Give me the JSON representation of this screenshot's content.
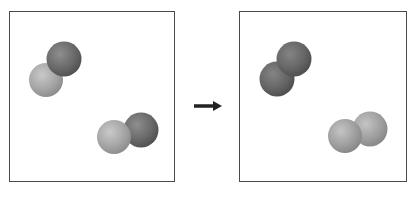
{
  "diagram": {
    "colors": {
      "dark_atom": "#6e6e6e",
      "light_atom": "#a8a8a8",
      "border": "#4a4a4a",
      "arrow": "#222222"
    },
    "panels": [
      {
        "label": "reactants",
        "molecules": [
          {
            "atoms": [
              "light",
              "dark"
            ]
          },
          {
            "atoms": [
              "light",
              "dark"
            ]
          }
        ]
      },
      {
        "label": "products",
        "molecules": [
          {
            "atoms": [
              "dark",
              "dark"
            ]
          },
          {
            "atoms": [
              "light",
              "light"
            ]
          }
        ]
      }
    ],
    "arrow": "right-arrow"
  }
}
